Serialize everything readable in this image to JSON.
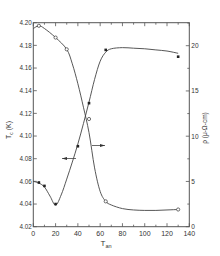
{
  "chart_data": {
    "type": "line",
    "title": "",
    "xlabel": "T_an",
    "ylabel_left": "T_c (K)",
    "ylabel_right": "ρ (μ-Ω-cm)",
    "xlim": [
      0,
      140
    ],
    "ylim_left": [
      4.02,
      4.2
    ],
    "ylim_right": [
      0,
      22.5
    ],
    "x_ticks": [
      0,
      20,
      40,
      60,
      80,
      100,
      120,
      140
    ],
    "y_left_ticks": [
      4.02,
      4.04,
      4.06,
      4.08,
      4.1,
      4.12,
      4.14,
      4.16,
      4.18,
      4.2
    ],
    "y_right_ticks": [
      0,
      5,
      10,
      15,
      20
    ],
    "grid": false,
    "series": [
      {
        "name": "T_c",
        "axis": "left",
        "marker": "filled-square",
        "x": [
          5,
          10,
          20,
          40,
          50,
          65,
          130
        ],
        "values": [
          4.059,
          4.056,
          4.04,
          4.091,
          4.129,
          4.176,
          4.17
        ],
        "curve_x": [
          0,
          5,
          10,
          15,
          20,
          25,
          30,
          35,
          40,
          45,
          50,
          55,
          60,
          65,
          70,
          80,
          90,
          100,
          110,
          120,
          130
        ],
        "curve_y": [
          4.06,
          4.0585,
          4.055,
          4.047,
          4.039,
          4.048,
          4.062,
          4.077,
          4.093,
          4.111,
          4.13,
          4.15,
          4.166,
          4.174,
          4.177,
          4.178,
          4.1775,
          4.177,
          4.176,
          4.175,
          4.173
        ]
      },
      {
        "name": "ρ",
        "axis": "right",
        "marker": "open-circle",
        "x": [
          5,
          20,
          30,
          50,
          65,
          130
        ],
        "values": [
          22.2,
          20.9,
          19.6,
          11.9,
          2.8,
          1.9
        ],
        "curve_x": [
          0,
          5,
          10,
          20,
          30,
          35,
          40,
          45,
          50,
          55,
          60,
          65,
          70,
          80,
          90,
          100,
          110,
          120,
          130
        ],
        "curve_y": [
          21.9,
          22.2,
          21.9,
          20.9,
          19.6,
          18.0,
          15.8,
          13.2,
          10.4,
          6.5,
          3.9,
          2.8,
          2.4,
          2.0,
          1.85,
          1.8,
          1.8,
          1.85,
          1.9
        ]
      }
    ],
    "annotations": [
      {
        "type": "arrow",
        "direction": "left",
        "label": "points to T_c axis",
        "x": 42,
        "y_left": 4.08
      },
      {
        "type": "arrow",
        "direction": "right",
        "label": "points to ρ axis",
        "x": 55,
        "y_right": 9.0
      }
    ],
    "legend": "none"
  },
  "axis_labels": {
    "x": "T",
    "x_sub": "an",
    "left": "T",
    "left_sub": "c",
    "left_unit": " (K)",
    "right": "ρ (μ-Ω-cm)"
  }
}
